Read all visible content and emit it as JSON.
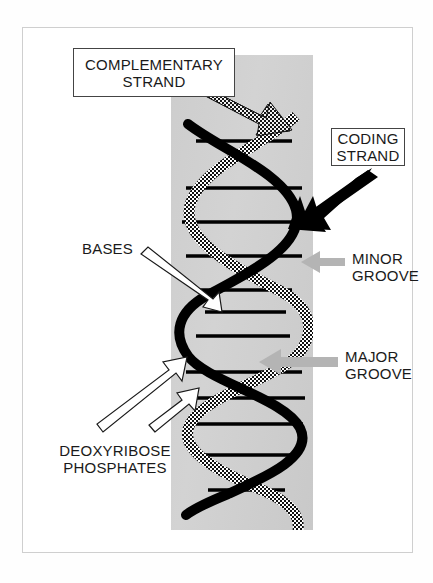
{
  "figure": {
    "panel_color": "#cfcfcf",
    "frame_color": "#cfcfcf",
    "background_color": "#ffffff"
  },
  "labels": {
    "complementary_strand": {
      "line1": "COMPLEMENTARY",
      "line2": "STRAND",
      "style": "boxed",
      "arrow": "dotted-thick-arrow-down-right",
      "arrow_color": "#1a1a1a"
    },
    "coding_strand": {
      "line1": "CODING",
      "line2": "STRAND",
      "style": "boxed",
      "arrow": "solid-black-arrow-down-left",
      "arrow_color": "#000000"
    },
    "minor_groove": {
      "line1": "MINOR",
      "line2": "GROOVE",
      "style": "plain",
      "arrow": "gray-arrow-left",
      "arrow_color": "#b0b0b0"
    },
    "major_groove": {
      "line1": "MAJOR",
      "line2": "GROOVE",
      "style": "plain",
      "arrow": "gray-arrow-left",
      "arrow_color": "#b0b0b0"
    },
    "bases": {
      "line1": "BASES",
      "style": "plain",
      "arrow": "white-outline-arrow-down-right",
      "arrow_color": "#ffffff"
    },
    "deoxyribose_phosphates": {
      "line1": "DEOXYRIBOSE",
      "line2": "PHOSPHATES",
      "style": "plain",
      "arrow": "white-outline-arrow-up-right",
      "arrow_count": 2,
      "arrow_color": "#ffffff"
    }
  },
  "helix": {
    "coding_strand_style": "solid-black",
    "complementary_strand_style": "dotted-checkered",
    "base_pair_rung_count": 12,
    "rung_color": "#000000",
    "stroke_width": 9
  }
}
